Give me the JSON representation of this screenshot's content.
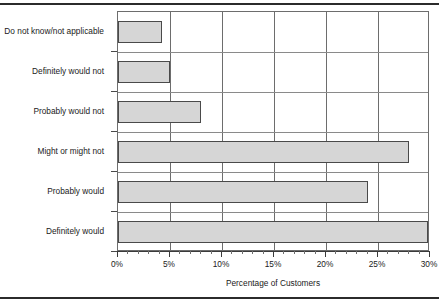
{
  "chart_data": {
    "type": "bar",
    "orientation": "horizontal",
    "title": "",
    "xlabel": "Percentage of Customers",
    "ylabel": "",
    "xlim": [
      0,
      30
    ],
    "grid": true,
    "legend_position": "none",
    "bar_color": "#d6d6d6",
    "bar_edge_color": "#4a4a4a",
    "categories": [
      "Do not know/not applicable",
      "Definitely would not",
      "Probably would not",
      "Might or might not",
      "Probably would",
      "Definitely would"
    ],
    "values": [
      4.2,
      5.0,
      8.0,
      28.0,
      24.0,
      29.8
    ],
    "value_labels": [
      "4.2%",
      "5.0%",
      "8.0%",
      "28.0%",
      "24.0%",
      "29.8%"
    ],
    "x_ticks": [
      0,
      5,
      10,
      15,
      20,
      25,
      30
    ],
    "x_tick_labels": [
      "0%",
      "5%",
      "10%",
      "15%",
      "20%",
      "25%",
      "30%"
    ],
    "x_minor_tick_step": 1
  }
}
